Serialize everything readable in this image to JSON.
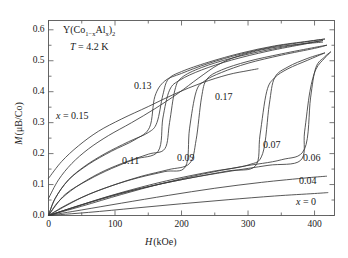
{
  "figure": {
    "title_parts": {
      "lead": "Y(Co",
      "sub1": "1−x",
      "mid": "Al",
      "sub2": "x",
      "close": ")",
      "sub3": "2"
    },
    "temperature_label": "T = 4.2 K",
    "temperature_italic": "T",
    "temperature_value": "= 4.2 K"
  },
  "axes": {
    "x_label": "H (kOe)",
    "x_label_italic": "H",
    "x_label_unit": "(kOe)",
    "y_label": "M (μB/Co)",
    "y_label_italic": "M",
    "y_label_unit": "(μB/Co)",
    "x_ticks": [
      "0",
      "100",
      "200",
      "300",
      "400"
    ],
    "y_ticks": [
      "0.0",
      "0.1",
      "0.2",
      "0.3",
      "0.4",
      "0.5",
      "0.6"
    ],
    "xlim": [
      0,
      430
    ],
    "ylim": [
      0,
      0.63
    ],
    "x_minor_step": 50,
    "y_minor_step": 0.05,
    "frame_color": "#555555",
    "curve_color": "#3a3a3a"
  },
  "annotations": [
    {
      "name": "label-x-015",
      "text": "x = 0.15",
      "italic": "x",
      "rest": "= 0.15",
      "x": 56,
      "y": 110
    },
    {
      "name": "label-013",
      "text": "0.13",
      "x": 134,
      "y": 80
    },
    {
      "name": "label-011",
      "text": "0.11",
      "x": 122,
      "y": 155
    },
    {
      "name": "label-009",
      "text": "0.09",
      "x": 177,
      "y": 152
    },
    {
      "name": "label-017",
      "text": "0.17",
      "x": 215,
      "y": 91
    },
    {
      "name": "label-007",
      "text": "0.07",
      "x": 263,
      "y": 139
    },
    {
      "name": "label-006",
      "text": "0.06",
      "x": 303,
      "y": 152
    },
    {
      "name": "label-004",
      "text": "0.04",
      "x": 299,
      "y": 175
    },
    {
      "name": "label-x-0",
      "text": "x = 0",
      "italic": "x",
      "rest": "= 0",
      "x": 296,
      "y": 196
    }
  ],
  "chart_data": {
    "type": "line",
    "xlabel": "H (kOe)",
    "ylabel": "M (μB/Co)",
    "xlim": [
      0,
      430
    ],
    "ylim": [
      0,
      0.63
    ],
    "grid": false,
    "legend": "inline-annotations",
    "x_ticks": [
      0,
      100,
      200,
      300,
      400
    ],
    "y_ticks": [
      0.0,
      0.1,
      0.2,
      0.3,
      0.4,
      0.5,
      0.6
    ],
    "series": [
      {
        "name": "x = 0.17",
        "label": "0.17",
        "type": "smooth-monotonic",
        "points": [
          [
            0,
            0.12
          ],
          [
            20,
            0.175
          ],
          [
            45,
            0.225
          ],
          [
            75,
            0.272
          ],
          [
            110,
            0.312
          ],
          [
            150,
            0.352
          ],
          [
            190,
            0.393
          ],
          [
            230,
            0.428
          ],
          [
            270,
            0.455
          ],
          [
            300,
            0.468
          ],
          [
            315,
            0.474
          ]
        ]
      },
      {
        "name": "x = 0.15",
        "label": "x = 0.15",
        "type": "smooth-monotonic",
        "points": [
          [
            0,
            0.055
          ],
          [
            15,
            0.115
          ],
          [
            35,
            0.168
          ],
          [
            60,
            0.215
          ],
          [
            90,
            0.258
          ],
          [
            125,
            0.3
          ],
          [
            160,
            0.345
          ],
          [
            195,
            0.395
          ],
          [
            225,
            0.443
          ],
          [
            255,
            0.487
          ],
          [
            285,
            0.515
          ],
          [
            320,
            0.535
          ],
          [
            355,
            0.548
          ],
          [
            390,
            0.556
          ],
          [
            412,
            0.56
          ]
        ]
      },
      {
        "name": "x = 0.13",
        "label": "0.13",
        "type": "metamagnetic-hysteresis",
        "transition_field": 163,
        "hysteresis_width": 12,
        "m_before": 0.27,
        "m_after": 0.45,
        "points_up": [
          [
            0,
            0.0
          ],
          [
            10,
            0.055
          ],
          [
            30,
            0.115
          ],
          [
            55,
            0.16
          ],
          [
            85,
            0.2
          ],
          [
            120,
            0.238
          ],
          [
            150,
            0.268
          ],
          [
            163,
            0.3
          ],
          [
            172,
            0.39
          ],
          [
            180,
            0.44
          ],
          [
            200,
            0.465
          ],
          [
            240,
            0.495
          ],
          [
            290,
            0.525
          ],
          [
            340,
            0.548
          ],
          [
            390,
            0.563
          ],
          [
            415,
            0.57
          ]
        ],
        "points_down": [
          [
            415,
            0.57
          ],
          [
            390,
            0.562
          ],
          [
            340,
            0.546
          ],
          [
            290,
            0.522
          ],
          [
            240,
            0.491
          ],
          [
            200,
            0.459
          ],
          [
            175,
            0.435
          ],
          [
            160,
            0.385
          ],
          [
            152,
            0.285
          ],
          [
            130,
            0.245
          ],
          [
            95,
            0.208
          ],
          [
            60,
            0.165
          ],
          [
            30,
            0.115
          ],
          [
            10,
            0.055
          ],
          [
            0,
            0.0
          ]
        ]
      },
      {
        "name": "x = 0.11",
        "label": "0.11",
        "type": "metamagnetic-hysteresis",
        "transition_field": 178,
        "hysteresis_width": 14,
        "m_before": 0.215,
        "m_after": 0.43,
        "points_up": [
          [
            0,
            0.0
          ],
          [
            15,
            0.045
          ],
          [
            40,
            0.09
          ],
          [
            75,
            0.135
          ],
          [
            110,
            0.168
          ],
          [
            150,
            0.198
          ],
          [
            175,
            0.216
          ],
          [
            182,
            0.3
          ],
          [
            190,
            0.405
          ],
          [
            200,
            0.445
          ],
          [
            230,
            0.478
          ],
          [
            275,
            0.508
          ],
          [
            330,
            0.535
          ],
          [
            385,
            0.556
          ],
          [
            412,
            0.565
          ]
        ],
        "points_down": [
          [
            412,
            0.565
          ],
          [
            385,
            0.554
          ],
          [
            330,
            0.531
          ],
          [
            275,
            0.502
          ],
          [
            230,
            0.47
          ],
          [
            198,
            0.438
          ],
          [
            182,
            0.405
          ],
          [
            172,
            0.315
          ],
          [
            165,
            0.208
          ],
          [
            130,
            0.182
          ],
          [
            95,
            0.152
          ],
          [
            60,
            0.115
          ],
          [
            25,
            0.068
          ],
          [
            0,
            0.0
          ]
        ]
      },
      {
        "name": "x = 0.09",
        "label": "0.09",
        "type": "metamagnetic-hysteresis",
        "transition_field": 222,
        "hysteresis_width": 12,
        "m_before": 0.16,
        "m_after": 0.44,
        "points_up": [
          [
            0,
            0.0
          ],
          [
            25,
            0.032
          ],
          [
            60,
            0.068
          ],
          [
            100,
            0.1
          ],
          [
            140,
            0.127
          ],
          [
            180,
            0.148
          ],
          [
            212,
            0.168
          ],
          [
            222,
            0.245
          ],
          [
            230,
            0.38
          ],
          [
            238,
            0.44
          ],
          [
            260,
            0.47
          ],
          [
            300,
            0.498
          ],
          [
            350,
            0.522
          ],
          [
            400,
            0.543
          ],
          [
            418,
            0.55
          ]
        ],
        "points_down": [
          [
            418,
            0.55
          ],
          [
            400,
            0.54
          ],
          [
            350,
            0.518
          ],
          [
            300,
            0.492
          ],
          [
            260,
            0.462
          ],
          [
            235,
            0.435
          ],
          [
            222,
            0.4
          ],
          [
            212,
            0.28
          ],
          [
            206,
            0.158
          ],
          [
            175,
            0.142
          ],
          [
            135,
            0.122
          ],
          [
            95,
            0.096
          ],
          [
            50,
            0.058
          ],
          [
            0,
            0.0
          ]
        ]
      },
      {
        "name": "x = 0.07",
        "label": "0.07",
        "type": "metamagnetic-hysteresis",
        "transition_field": 328,
        "hysteresis_width": 14,
        "m_before": 0.165,
        "m_after": 0.45,
        "points_up": [
          [
            0,
            0.0
          ],
          [
            40,
            0.028
          ],
          [
            90,
            0.062
          ],
          [
            140,
            0.092
          ],
          [
            190,
            0.118
          ],
          [
            245,
            0.142
          ],
          [
            300,
            0.163
          ],
          [
            322,
            0.2
          ],
          [
            332,
            0.36
          ],
          [
            340,
            0.445
          ],
          [
            360,
            0.48
          ],
          [
            390,
            0.508
          ],
          [
            415,
            0.525
          ]
        ],
        "points_down": [
          [
            415,
            0.525
          ],
          [
            390,
            0.502
          ],
          [
            360,
            0.474
          ],
          [
            340,
            0.445
          ],
          [
            328,
            0.4
          ],
          [
            318,
            0.26
          ],
          [
            311,
            0.16
          ],
          [
            270,
            0.144
          ],
          [
            215,
            0.122
          ],
          [
            160,
            0.098
          ],
          [
            105,
            0.07
          ],
          [
            50,
            0.035
          ],
          [
            0,
            0.0
          ]
        ]
      },
      {
        "name": "x = 0.06",
        "label": "0.06",
        "type": "metamagnetic-hysteresis",
        "transition_field": 392,
        "hysteresis_width": 10,
        "m_before": 0.185,
        "m_after": 0.48,
        "points_up": [
          [
            0,
            0.0
          ],
          [
            50,
            0.03
          ],
          [
            110,
            0.068
          ],
          [
            170,
            0.103
          ],
          [
            230,
            0.133
          ],
          [
            290,
            0.158
          ],
          [
            350,
            0.18
          ],
          [
            385,
            0.215
          ],
          [
            394,
            0.38
          ],
          [
            402,
            0.478
          ],
          [
            415,
            0.512
          ],
          [
            424,
            0.528
          ]
        ],
        "points_down": [
          [
            424,
            0.528
          ],
          [
            415,
            0.508
          ],
          [
            402,
            0.472
          ],
          [
            393,
            0.4
          ],
          [
            385,
            0.27
          ],
          [
            379,
            0.178
          ],
          [
            330,
            0.162
          ],
          [
            270,
            0.142
          ],
          [
            205,
            0.118
          ],
          [
            140,
            0.088
          ],
          [
            75,
            0.05
          ],
          [
            0,
            0.0
          ]
        ]
      },
      {
        "name": "x = 0.04",
        "label": "0.04",
        "type": "smooth-linear",
        "points": [
          [
            0,
            0.0
          ],
          [
            50,
            0.018
          ],
          [
            110,
            0.04
          ],
          [
            180,
            0.065
          ],
          [
            250,
            0.088
          ],
          [
            320,
            0.107
          ],
          [
            390,
            0.122
          ],
          [
            418,
            0.127
          ]
        ]
      },
      {
        "name": "x = 0",
        "label": "x = 0",
        "type": "smooth-linear",
        "points": [
          [
            0,
            0.0
          ],
          [
            60,
            0.01
          ],
          [
            130,
            0.024
          ],
          [
            200,
            0.038
          ],
          [
            270,
            0.051
          ],
          [
            340,
            0.063
          ],
          [
            400,
            0.071
          ],
          [
            420,
            0.074
          ]
        ]
      }
    ]
  }
}
